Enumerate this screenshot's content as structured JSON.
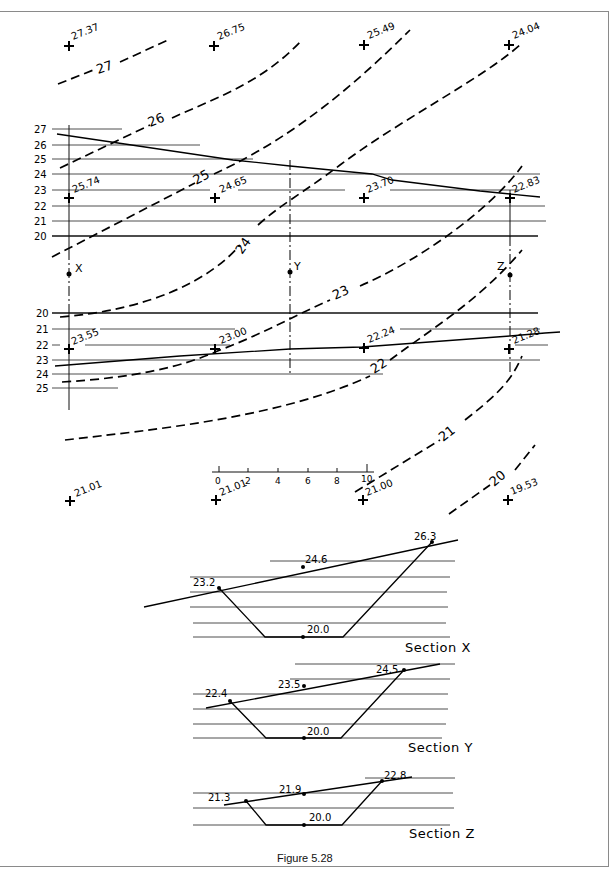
{
  "figure": {
    "caption": "Figure 5.28",
    "type": "contour plan with cross sections"
  },
  "spot_heights": [
    {
      "label": "27.37"
    },
    {
      "label": "26.75"
    },
    {
      "label": "25.49"
    },
    {
      "label": "24.04"
    },
    {
      "label": "25.74"
    },
    {
      "label": "24.65"
    },
    {
      "label": "23.70"
    },
    {
      "label": "22.83"
    },
    {
      "label": "23.55"
    },
    {
      "label": "23.00"
    },
    {
      "label": "22.24"
    },
    {
      "label": "21.28"
    },
    {
      "label": "21.01"
    },
    {
      "label": "21.01"
    },
    {
      "label": "21.00"
    },
    {
      "label": "19.53"
    }
  ],
  "contours": [
    "27",
    "26",
    "25",
    "24",
    "23",
    "22",
    "21",
    "20"
  ],
  "section_markers": [
    "X",
    "Y",
    "Z"
  ],
  "upper_scale_labels": [
    "27",
    "26",
    "25",
    "24",
    "23",
    "22",
    "21",
    "20"
  ],
  "lower_scale_labels": [
    "20",
    "21",
    "22",
    "23",
    "24",
    "25"
  ],
  "scale_bar": {
    "ticks": [
      "0",
      "2",
      "4",
      "6",
      "8",
      "10"
    ]
  },
  "sections": [
    {
      "name": "Section X",
      "left": "23.2",
      "mid": "24.6",
      "right": "26.3",
      "bottom": "20.0"
    },
    {
      "name": "Section Y",
      "left": "22.4",
      "mid": "23.5",
      "right": "24.5",
      "bottom": "20.0"
    },
    {
      "name": "Section Z",
      "left": "21.3",
      "mid": "21.9",
      "right": "22.8",
      "bottom": "20.0"
    }
  ]
}
